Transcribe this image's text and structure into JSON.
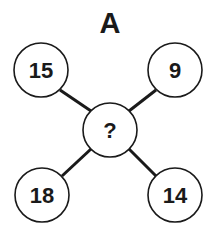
{
  "diagram": {
    "title": "A",
    "center": {
      "label": "?"
    },
    "nodes": [
      {
        "position": "top-left",
        "label": "15"
      },
      {
        "position": "top-right",
        "label": "9"
      },
      {
        "position": "bottom-left",
        "label": "18"
      },
      {
        "position": "bottom-right",
        "label": "14"
      }
    ]
  }
}
